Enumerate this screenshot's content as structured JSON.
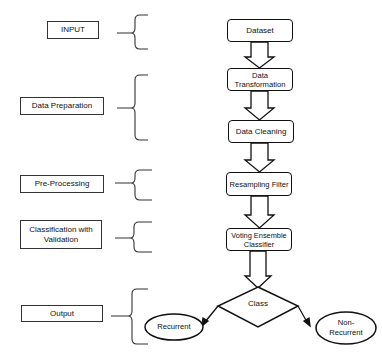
{
  "stages": [
    {
      "label": "INPUT"
    },
    {
      "label": "Data Preparation"
    },
    {
      "label": "Pre-Processing"
    },
    {
      "label": "Classification with Validation"
    },
    {
      "label": "Output"
    }
  ],
  "steps": [
    {
      "label": "Dataset"
    },
    {
      "label": "Data Transformation"
    },
    {
      "label": "Data Cleaning"
    },
    {
      "label": "Resampling Filter"
    },
    {
      "label": "Voting Ensemble Classifier"
    }
  ],
  "decision": {
    "label": "Class"
  },
  "outcomes": [
    {
      "label": "Recurrent"
    },
    {
      "label": "Non-Recurrent"
    }
  ]
}
